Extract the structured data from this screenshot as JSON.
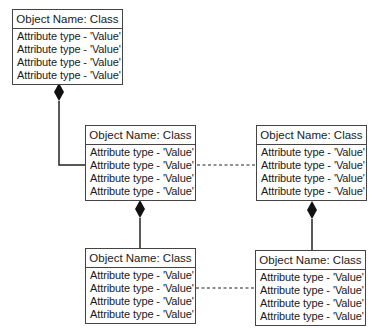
{
  "diagram": {
    "type": "UML object diagram",
    "objects": [
      {
        "id": "obj1",
        "header": "Object Name: Class",
        "attributes": [
          "Attribute type - 'Value'",
          "Attribute type - 'Value'",
          "Attribute type - 'Value'",
          "Attribute type - 'Value'"
        ]
      },
      {
        "id": "obj2",
        "header": "Object Name: Class",
        "attributes": [
          "Attribute type - 'Value'",
          "Attribute type - 'Value'",
          "Attribute type - 'Value'",
          "Attribute type - 'Value'"
        ]
      },
      {
        "id": "obj3",
        "header": "Object Name: Class",
        "attributes": [
          "Attribute type - 'Value'",
          "Attribute type - 'Value'",
          "Attribute type - 'Value'",
          "Attribute type - 'Value'"
        ]
      },
      {
        "id": "obj4",
        "header": "Object Name: Class",
        "attributes": [
          "Attribute type - 'Value'",
          "Attribute type - 'Value'",
          "Attribute type - 'Value'",
          "Attribute type - 'Value'"
        ]
      },
      {
        "id": "obj5",
        "header": "Object Name: Class",
        "attributes": [
          "Attribute type - 'Value'",
          "Attribute type - 'Value'",
          "Attribute type - 'Value'",
          "Attribute type - 'Value'"
        ]
      }
    ],
    "connections": [
      {
        "from": "obj1",
        "to": "obj2",
        "type": "composition"
      },
      {
        "from": "obj2",
        "to": "obj3",
        "type": "dashed-link"
      },
      {
        "from": "obj2",
        "to": "obj4",
        "type": "composition"
      },
      {
        "from": "obj3",
        "to": "obj5",
        "type": "composition"
      },
      {
        "from": "obj4",
        "to": "obj5",
        "type": "dashed-link"
      }
    ],
    "colors": {
      "line": "#222222",
      "border": "#444444",
      "background": "#ffffff"
    }
  }
}
